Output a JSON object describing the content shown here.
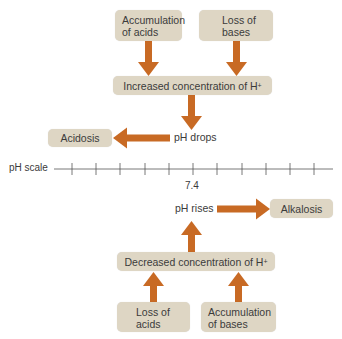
{
  "colors": {
    "box_fill": "#ded6c4",
    "arrow": "#c86a24",
    "text": "#3b3b3b",
    "scale_line": "#555555"
  },
  "acidosis_path": {
    "causes": [
      {
        "line1": "Accumulation",
        "line2": "of acids"
      },
      {
        "line1": "Loss of",
        "line2": "bases"
      }
    ],
    "result_prefix": "Increased concentration of H",
    "result_sup": "+",
    "ph_change": "pH drops",
    "outcome": "Acidosis"
  },
  "scale": {
    "label": "pH scale",
    "center_value": "7.4",
    "tick_count": 11
  },
  "alkalosis_path": {
    "ph_change": "pH rises",
    "outcome": "Alkalosis",
    "result_prefix": "Decreased concentration of H",
    "result_sup": "+",
    "causes": [
      {
        "line1": "Loss of",
        "line2": "acids"
      },
      {
        "line1": "Accumulation",
        "line2": "of bases"
      }
    ]
  }
}
